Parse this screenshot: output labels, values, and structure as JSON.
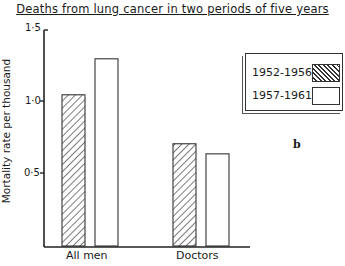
{
  "chart_data": {
    "type": "bar",
    "title": "Deaths from lung cancer in two periods of five years",
    "xlabel": "",
    "ylabel": "Mortality rate per thousand",
    "ylim": [
      0,
      1.5
    ],
    "yticks": [
      "0·5",
      "1·0",
      "1·5"
    ],
    "categories": [
      "All men",
      "Doctors"
    ],
    "series": [
      {
        "name": "1952-1956",
        "pattern": "hatched",
        "values": [
          1.05,
          0.71
        ]
      },
      {
        "name": "1957-1961",
        "pattern": "open",
        "values": [
          1.3,
          0.64
        ]
      }
    ],
    "legend_position": "upper right",
    "grid": false,
    "annotation": "b"
  },
  "labels": {
    "title": "Deaths from lung cancer in two periods of five years",
    "ylabel": "Mortality rate per thousand",
    "tick_05": "0·5",
    "tick_10": "1·0",
    "tick_15": "1·5",
    "cat_0": "All men",
    "cat_1": "Doctors",
    "legend_0": "1952-1956",
    "legend_1": "1957-1961",
    "sub_label": "b"
  }
}
